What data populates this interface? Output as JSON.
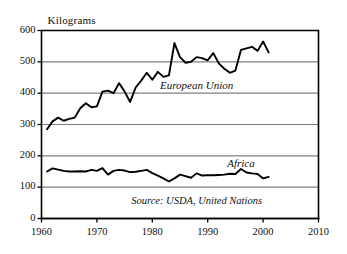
{
  "chart_data": {
    "type": "line",
    "title": "",
    "subtitle": "",
    "ylabel": "Kilograms",
    "xlabel": "",
    "xlim": [
      1960,
      2010
    ],
    "ylim": [
      0,
      600
    ],
    "yticks": [
      0,
      100,
      200,
      300,
      400,
      500,
      600
    ],
    "xticks": [
      1960,
      1970,
      1980,
      1990,
      2000,
      2010
    ],
    "grid": "horizontal",
    "legend_position": "inline-annotation",
    "annotations": [
      {
        "text": "European Union",
        "x": 1988,
        "y": 420
      },
      {
        "text": "Africa",
        "x": 1996,
        "y": 170
      },
      {
        "text": "Source: USDA, United Nations",
        "x": 1988,
        "y": 48
      }
    ],
    "series": [
      {
        "name": "European Union",
        "x": [
          1961,
          1962,
          1963,
          1964,
          1965,
          1966,
          1967,
          1968,
          1969,
          1970,
          1971,
          1972,
          1973,
          1974,
          1975,
          1976,
          1977,
          1978,
          1979,
          1980,
          1981,
          1982,
          1983,
          1984,
          1985,
          1986,
          1987,
          1988,
          1989,
          1990,
          1991,
          1992,
          1993,
          1994,
          1995,
          1996,
          1997,
          1998,
          1999,
          2000,
          2001
        ],
        "values": [
          285,
          310,
          322,
          312,
          318,
          322,
          352,
          368,
          355,
          358,
          405,
          408,
          400,
          432,
          405,
          372,
          418,
          440,
          465,
          443,
          468,
          452,
          457,
          560,
          515,
          497,
          500,
          515,
          512,
          505,
          528,
          495,
          478,
          465,
          472,
          538,
          543,
          548,
          535,
          565,
          530
        ]
      },
      {
        "name": "Africa",
        "x": [
          1961,
          1962,
          1963,
          1964,
          1965,
          1966,
          1967,
          1968,
          1969,
          1970,
          1971,
          1972,
          1973,
          1974,
          1975,
          1976,
          1977,
          1978,
          1979,
          1980,
          1981,
          1982,
          1983,
          1984,
          1985,
          1986,
          1987,
          1988,
          1989,
          1990,
          1991,
          1992,
          1993,
          1994,
          1995,
          1996,
          1997,
          1998,
          1999,
          2000,
          2001
        ],
        "values": [
          150,
          160,
          156,
          152,
          150,
          150,
          151,
          150,
          155,
          152,
          161,
          140,
          152,
          155,
          153,
          148,
          149,
          152,
          155,
          145,
          137,
          128,
          118,
          128,
          140,
          135,
          130,
          144,
          137,
          138,
          138,
          139,
          140,
          143,
          142,
          158,
          147,
          144,
          142,
          128,
          133
        ]
      }
    ]
  },
  "axis_labels": {
    "y_title": "Kilograms",
    "y_ticks": [
      "0",
      "100",
      "200",
      "300",
      "400",
      "500",
      "600"
    ],
    "x_ticks": [
      "1960",
      "1970",
      "1980",
      "1990",
      "2000",
      "2010"
    ]
  },
  "labels": {
    "series_eu": "European Union",
    "series_africa": "Africa",
    "source": "Source: USDA, United Nations"
  },
  "colors": {
    "line": "#000000",
    "frame": "#000000",
    "grid": "#808080",
    "background": "#ffffff",
    "text": "#111111"
  }
}
